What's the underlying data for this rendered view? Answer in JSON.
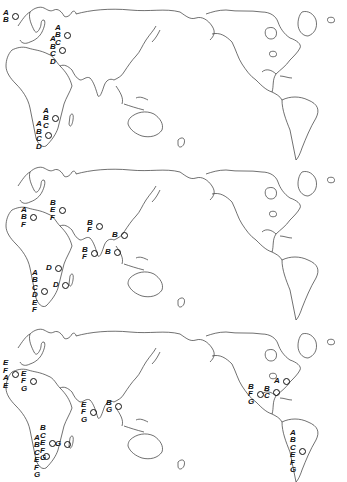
{
  "figure": {
    "panels": [
      {
        "id": "map-1",
        "sites": [
          {
            "region": "british-isles",
            "labels": [
              "A",
              "B"
            ],
            "x": 15,
            "y": 16
          },
          {
            "region": "northern-russia",
            "labels": [
              "A",
              "B",
              "C"
            ],
            "x": 67,
            "y": 35
          },
          {
            "region": "eastern-europe",
            "labels": [
              "A",
              "B",
              "C",
              "D"
            ],
            "x": 62,
            "y": 50
          },
          {
            "region": "east-africa",
            "labels": [
              "A",
              "B",
              "C"
            ],
            "x": 55,
            "y": 118
          },
          {
            "region": "south-africa",
            "labels": [
              "A",
              "B",
              "C",
              "D"
            ],
            "x": 48,
            "y": 135
          }
        ]
      },
      {
        "id": "map-2",
        "sites": [
          {
            "region": "western-europe",
            "labels": [
              "A",
              "B",
              "F"
            ],
            "x": 33,
            "y": 217
          },
          {
            "region": "central-russia",
            "labels": [
              "B",
              "E",
              "F"
            ],
            "x": 62,
            "y": 210
          },
          {
            "region": "central-asia",
            "labels": [
              "B",
              "F"
            ],
            "x": 99,
            "y": 226
          },
          {
            "region": "china",
            "labels": [
              "B"
            ],
            "x": 124,
            "y": 235
          },
          {
            "region": "india",
            "labels": [
              "B",
              "F"
            ],
            "x": 94,
            "y": 253
          },
          {
            "region": "southeast-asia",
            "labels": [
              "B"
            ],
            "x": 117,
            "y": 252
          },
          {
            "region": "east-africa",
            "labels": [
              "D"
            ],
            "x": 58,
            "y": 268
          },
          {
            "region": "madagascar",
            "labels": [
              "D"
            ],
            "x": 65,
            "y": 285
          },
          {
            "region": "south-africa",
            "labels": [
              "A",
              "B",
              "C",
              "D",
              "E",
              "F"
            ],
            "x": 44,
            "y": 291
          }
        ]
      },
      {
        "id": "map-3",
        "sites": [
          {
            "region": "british-isles",
            "labels": [
              "E",
              "F",
              "A",
              "E"
            ],
            "x": 15,
            "y": 374
          },
          {
            "region": "western-europe",
            "labels": [
              "E",
              "F",
              "G"
            ],
            "x": 33,
            "y": 381
          },
          {
            "region": "india",
            "labels": [
              "E",
              "F",
              "G"
            ],
            "x": 93,
            "y": 412
          },
          {
            "region": "china",
            "labels": [
              "B",
              "G"
            ],
            "x": 118,
            "y": 406
          },
          {
            "region": "east-africa",
            "labels": [
              "B",
              "C",
              "E",
              "F",
              "G"
            ],
            "x": 52,
            "y": 443
          },
          {
            "region": "madagascar",
            "labels": [
              "G"
            ],
            "x": 67,
            "y": 444
          },
          {
            "region": "south-africa",
            "labels": [
              "A",
              "B",
              "C",
              "E",
              "F",
              "G"
            ],
            "x": 46,
            "y": 456
          },
          {
            "region": "western-north-america",
            "labels": [
              "B",
              "F",
              "G"
            ],
            "x": 260,
            "y": 394
          },
          {
            "region": "great-lakes",
            "labels": [
              "B",
              "C"
            ],
            "x": 276,
            "y": 392
          },
          {
            "region": "northeast-north-america",
            "labels": [
              "A"
            ],
            "x": 286,
            "y": 381
          },
          {
            "region": "south-america",
            "labels": [
              "A",
              "B",
              "C",
              "E",
              "F",
              "G"
            ],
            "x": 302,
            "y": 451
          }
        ]
      }
    ],
    "legend_letters": [
      "A",
      "B",
      "C",
      "D",
      "E",
      "F",
      "G"
    ],
    "colors": {
      "ink": "#111111",
      "coastline": "#333333",
      "background": "#ffffff"
    }
  }
}
